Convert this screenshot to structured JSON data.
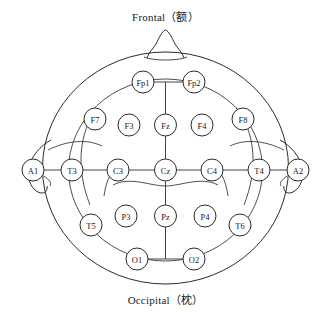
{
  "diagram": {
    "title_top": "Frontal（额）",
    "title_bottom": "Occipital（枕）",
    "type": "eeg-10-20-electrode-map",
    "colors": {
      "background": "#ffffff",
      "outline": "#2b2b2b",
      "connector": "#444444",
      "ring": "#3a3a3a",
      "node_fill": "#ffffff",
      "text": "#1a1a1a"
    },
    "head": {
      "outer_ellipse": {
        "cx": 165.5,
        "cy": 168,
        "rx": 123,
        "ry": 116
      },
      "inner_ellipse": {
        "cx": 165.5,
        "cy": 168,
        "rx": 97,
        "ry": 94
      },
      "nose": {
        "cx": 165.5,
        "tip_y": 30,
        "base_y": 55
      },
      "ear_left": {
        "x": 46,
        "y": 168
      },
      "ear_right": {
        "x": 285,
        "y": 168
      }
    },
    "electrodes": [
      {
        "id": "Fp1",
        "label": "Fp1",
        "cx": 143,
        "cy": 82,
        "r": 11
      },
      {
        "id": "Fp2",
        "label": "Fp2",
        "cx": 194,
        "cy": 82,
        "r": 11
      },
      {
        "id": "F7",
        "label": "F7",
        "cx": 95,
        "cy": 119,
        "r": 11
      },
      {
        "id": "F3",
        "label": "F3",
        "cx": 129,
        "cy": 125,
        "r": 11
      },
      {
        "id": "Fz",
        "label": "Fz",
        "cx": 165.5,
        "cy": 125,
        "r": 11
      },
      {
        "id": "F4",
        "label": "F4",
        "cx": 202,
        "cy": 125,
        "r": 11
      },
      {
        "id": "F8",
        "label": "F8",
        "cx": 243,
        "cy": 119,
        "r": 11
      },
      {
        "id": "A1",
        "label": "A1",
        "cx": 33,
        "cy": 170,
        "r": 11
      },
      {
        "id": "T3",
        "label": "T3",
        "cx": 72,
        "cy": 170,
        "r": 11
      },
      {
        "id": "C3",
        "label": "C3",
        "cx": 118,
        "cy": 170,
        "r": 11
      },
      {
        "id": "Cz",
        "label": "Cz",
        "cx": 165.5,
        "cy": 170,
        "r": 11
      },
      {
        "id": "C4",
        "label": "C4",
        "cx": 212,
        "cy": 170,
        "r": 11
      },
      {
        "id": "T4",
        "label": "T4",
        "cx": 259,
        "cy": 170,
        "r": 11
      },
      {
        "id": "A2",
        "label": "A2",
        "cx": 298,
        "cy": 170,
        "r": 11
      },
      {
        "id": "T5",
        "label": "T5",
        "cx": 91,
        "cy": 225,
        "r": 11
      },
      {
        "id": "P3",
        "label": "P3",
        "cx": 126,
        "cy": 216,
        "r": 11
      },
      {
        "id": "Pz",
        "label": "Pz",
        "cx": 165.5,
        "cy": 216,
        "r": 11
      },
      {
        "id": "P4",
        "label": "P4",
        "cx": 205,
        "cy": 216,
        "r": 11
      },
      {
        "id": "T6",
        "label": "T6",
        "cx": 240,
        "cy": 225,
        "r": 11
      },
      {
        "id": "O1",
        "label": "O1",
        "cx": 137,
        "cy": 259,
        "r": 11
      },
      {
        "id": "O2",
        "label": "O2",
        "cx": 194,
        "cy": 259,
        "r": 11
      }
    ],
    "connections": [
      {
        "from": "Fp1",
        "to": "Fp2"
      },
      {
        "from": "Fz",
        "to": "Fp1"
      },
      {
        "from": "Fz",
        "to": "Cz"
      },
      {
        "from": "T3",
        "to": "C3"
      },
      {
        "from": "C3",
        "to": "Cz"
      },
      {
        "from": "Cz",
        "to": "C4"
      },
      {
        "from": "C4",
        "to": "T4"
      },
      {
        "from": "A1",
        "to": "T3"
      },
      {
        "from": "T4",
        "to": "A2"
      },
      {
        "from": "Cz",
        "to": "Pz"
      },
      {
        "from": "Pz",
        "to": "O1"
      },
      {
        "from": "O1",
        "to": "O2"
      }
    ],
    "ring_order": [
      "Fp1",
      "F7",
      "T3",
      "T5",
      "O1",
      "O2",
      "T6",
      "T4",
      "F8",
      "Fp2"
    ]
  }
}
